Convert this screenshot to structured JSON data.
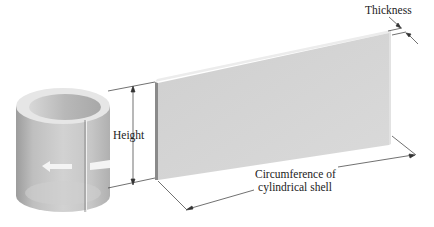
{
  "figure": {
    "labels": {
      "height": "Height",
      "thickness": "Thickness",
      "circumference_line1": "Circumference of",
      "circumference_line2": "cylindrical shell"
    },
    "colors": {
      "background": "#ffffff",
      "panel_face": "#d4d4d4",
      "panel_edge_dark": "#8a8a8a",
      "panel_top": "#ececec",
      "cylinder_body": "#c8c8c8",
      "cylinder_inner": "#bdbdbd",
      "arrow": "#f4f4f4",
      "line": "#333333"
    }
  }
}
